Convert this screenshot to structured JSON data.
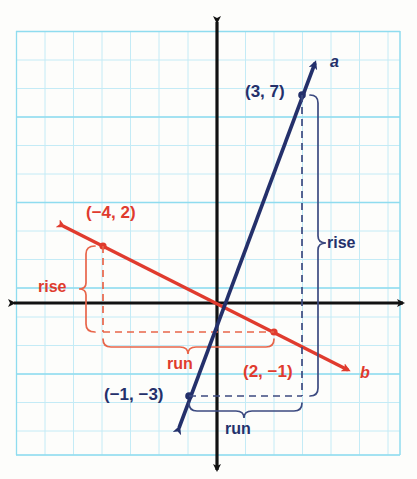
{
  "colors": {
    "grid_minor": "#bde9f4",
    "grid_major": "#7fd4ea",
    "axis": "#111111",
    "line_a": "#24306b",
    "line_b": "#e03b2e",
    "brace_a": "#3c4a80",
    "brace_b": "#e8654a",
    "paper": "#fdfdfb"
  },
  "axes": {
    "origin_px": [
      217,
      303
    ],
    "cell_px": 28.5,
    "x_range": [
      -7,
      6
    ],
    "y_range": [
      -5,
      9
    ]
  },
  "lines": [
    {
      "id": "a",
      "label": "a",
      "color": "#24306b",
      "points": [
        {
          "label": "(3, 7)",
          "x": 3,
          "y": 7
        },
        {
          "label": "(−1, −3)",
          "x": -1,
          "y": -3
        }
      ],
      "rise_label": "rise",
      "run_label": "run",
      "rise": 10,
      "run": 4,
      "slope": 2.5
    },
    {
      "id": "b",
      "label": "b",
      "color": "#e03b2e",
      "points": [
        {
          "label": "(−4, 2)",
          "x": -4,
          "y": 2
        },
        {
          "label": "(2, −1)",
          "x": 2,
          "y": -1
        }
      ],
      "rise_label": "rise",
      "run_label": "run",
      "rise": -3,
      "run": 6,
      "slope": -0.5
    }
  ],
  "labels": {
    "point_a_top": "(3, 7)",
    "point_a_bottom": "(−1, −3)",
    "point_b_top": "(−4, 2)",
    "point_b_bottom": "(2, −1)",
    "line_a_name": "a",
    "line_b_name": "b",
    "rise_a": "rise",
    "run_a": "run",
    "rise_b": "rise",
    "run_b": "run"
  }
}
